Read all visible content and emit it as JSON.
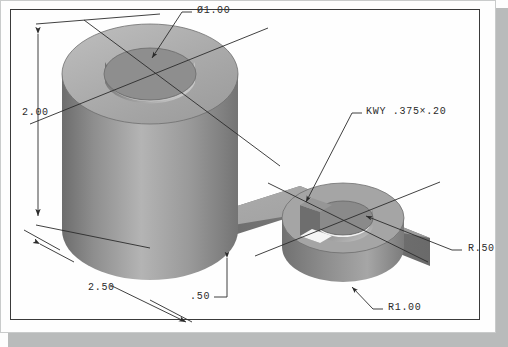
{
  "drawing": {
    "title": "Isometric pictorial of two-boss link plate",
    "background_color": "#fefefe",
    "line_color": "#2b2b2b",
    "shadow_color": "#b9bbbb",
    "part_light": "#d2d2d2",
    "part_mid": "#a8a8a8",
    "part_dark": "#7e7e7e",
    "part_darkest": "#636363"
  },
  "annotations": {
    "hole_diameter": "Ø1.00",
    "height": "2.00",
    "keyway": "KWY .375×.20",
    "length": "2.50",
    "plate_thickness": ".50",
    "small_boss_radius": "R.50",
    "large_boss_radius": "R1.00"
  },
  "callout_names": {
    "hole_diameter": "diameter-callout",
    "height": "height-dimension",
    "keyway": "keyway-callout",
    "length": "length-dimension",
    "plate_thickness": "thickness-dimension",
    "small_boss_radius": "small-radius-callout",
    "large_boss_radius": "large-radius-callout"
  }
}
